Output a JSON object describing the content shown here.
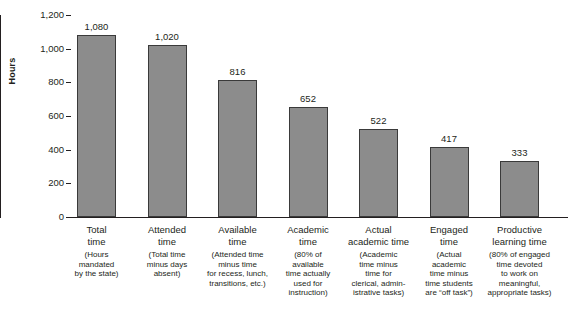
{
  "chart_data": {
    "type": "bar",
    "title": "",
    "xlabel": "",
    "ylabel": "Hours",
    "ylim": [
      0,
      1200
    ],
    "yticks": [
      "0",
      "200",
      "400",
      "600",
      "800",
      "1,000",
      "1,200"
    ],
    "ytick_values": [
      0,
      200,
      400,
      600,
      800,
      1000,
      1200
    ],
    "grid": false,
    "legend": false,
    "bar_color": "#8c8c8c",
    "bar_edge_color": "#3a3a3a",
    "axis_color": "#231f20",
    "categories": [
      "Total\ntime",
      "Attended\ntime",
      "Available\ntime",
      "Academic\ntime",
      "Actual\nacademic time",
      "Engaged\ntime",
      "Productive\nlearning time"
    ],
    "category_descriptions": [
      "(Hours\nmandated\nby the state)",
      "(Total time\nminus days\nabsent)",
      "(Attended time\nminus time\nfor recess, lunch,\ntransitions, etc.)",
      "(80% of\navailable\ntime actually\nused for\ninstruction)",
      "(Academic\ntime minus\ntime for\nclerical, admin-\nistrative tasks)",
      "(Actual\nacademic\ntime minus\ntime students\nare “off task”)",
      "(80% of engaged\ntime devoted\nto work on\nmeaningful,\nappropriate tasks)"
    ],
    "values": [
      1080,
      1020,
      816,
      652,
      522,
      417,
      333
    ],
    "value_labels": [
      "1,080",
      "1,020",
      "816",
      "652",
      "522",
      "417",
      "333"
    ]
  }
}
